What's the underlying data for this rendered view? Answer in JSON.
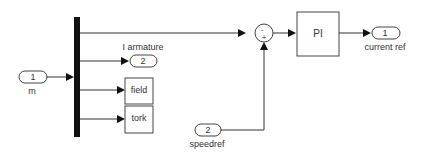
{
  "diagram": {
    "type": "simulink-block-diagram",
    "inports": [
      {
        "number": "1",
        "label": "m"
      },
      {
        "number": "2",
        "label": "speedref"
      }
    ],
    "outports": [
      {
        "number": "2",
        "label": "I armature"
      },
      {
        "number": "1",
        "label": "current ref"
      }
    ],
    "terminators": [
      {
        "label": "field"
      },
      {
        "label": "tork"
      }
    ],
    "sum": {
      "signs_top": "-",
      "signs_bottom": "+"
    },
    "controller": {
      "label": "PI"
    }
  }
}
